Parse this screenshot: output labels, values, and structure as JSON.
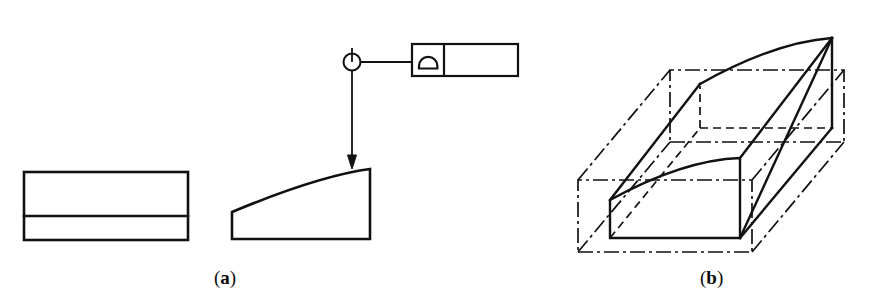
{
  "figure": {
    "type": "engineering-drawing",
    "background_color": "#ffffff",
    "line_color": "#111111",
    "captions": [
      {
        "id": "a",
        "open_paren": "(",
        "letter": "a",
        "close_paren": ")",
        "x": 237,
        "y": 283
      },
      {
        "id": "b",
        "open_paren": "(",
        "letter": "b",
        "close_paren": ")",
        "x": 723,
        "y": 283
      }
    ]
  },
  "panel_a": {
    "name": "orthographic-views",
    "top_view": {
      "name": "top-view-rectangle",
      "x": 24,
      "y": 172,
      "width": 164,
      "height": 68,
      "divider_y": 216,
      "stroke_width": 2.6
    },
    "side_view": {
      "name": "side-view-curved-profile",
      "left_x": 232,
      "right_x": 370,
      "bottom_y": 239,
      "left_top_y": 212,
      "right_top_y": 169,
      "curve_control_x": 318,
      "curve_control_y": 176,
      "stroke_width": 2.6
    },
    "callout": {
      "name": "surface-finish-callout",
      "circle": {
        "cx": 352,
        "cy": 62,
        "r": 8.5
      },
      "stem_top_y": 48,
      "leader_line": {
        "x1": 360,
        "y1": 62,
        "x2": 412,
        "y2": 62
      },
      "arrow_line": {
        "x1": 352,
        "y1": 70,
        "x2": 352,
        "y2": 168
      },
      "arrow_head": {
        "tip_x": 352,
        "tip_y": 169,
        "half_width": 4.5,
        "height": 13
      },
      "box": {
        "x": 412,
        "y": 44,
        "width": 106,
        "height": 32,
        "divider_x": 444
      },
      "symbol": {
        "name": "dome-symbol",
        "cx": 428,
        "cy": 66,
        "rx": 10,
        "ry": 10
      },
      "stroke_width": 2.0
    }
  },
  "panel_b": {
    "name": "isometric-pictorial",
    "solid": {
      "name": "curved-wedge-solid",
      "front_face": {
        "bottom_left": [
          610,
          238
        ],
        "bottom_right": [
          740,
          238
        ],
        "top_right": [
          740,
          158
        ],
        "curve_left_top": [
          610,
          200
        ],
        "curve_control": [
          683,
          160
        ]
      },
      "back_face": {
        "bottom_left": [
          700,
          128
        ],
        "bottom_right": [
          832,
          128
        ],
        "top_right": [
          832,
          38
        ],
        "curve_left_top": [
          700,
          84
        ],
        "curve_control": [
          775,
          42
        ]
      },
      "diagonal": {
        "x1": 740,
        "y1": 238,
        "x2": 832,
        "y2": 38
      },
      "stroke_width": 2.4
    },
    "phantom_box": {
      "name": "phantom-outline-box",
      "stroke_width": 1.6,
      "dash_pattern": "14 4 3 4",
      "front": {
        "bottom_left": [
          578,
          252
        ],
        "bottom_right": [
          752,
          252
        ],
        "top_right": [
          752,
          180
        ],
        "top_left": [
          578,
          180
        ]
      },
      "offset": [
        92,
        -110
      ]
    }
  }
}
